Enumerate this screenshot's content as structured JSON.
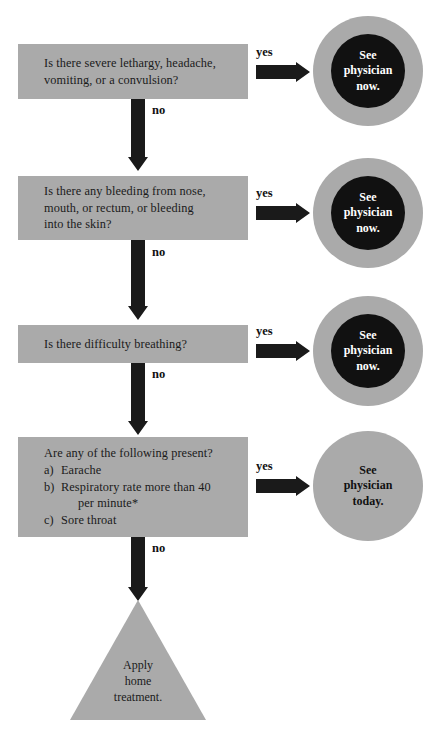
{
  "chart": {
    "colors": {
      "box_fill": "#aaaaaa",
      "ring_fill": "#aaaaaa",
      "core_fill": "#111111",
      "arrow_fill": "#1a1a1a",
      "text_dark": "#1a1a1a",
      "text_light": "#ffffff",
      "background": "#ffffff"
    }
  },
  "questions": [
    {
      "id": "q1",
      "line1": "Is there severe lethargy, headache,",
      "line2": "vomiting, or a convulsion?"
    },
    {
      "id": "q2",
      "line1": "Is there any bleeding from nose,",
      "line2": "mouth, or rectum, or bleeding",
      "line3": "into the skin?"
    },
    {
      "id": "q3",
      "line1": "Is there difficulty breathing?"
    },
    {
      "id": "q4",
      "lead": "Are any of the following present?",
      "items": [
        {
          "marker": "a)",
          "text": "Earache"
        },
        {
          "marker": "b)",
          "text": "Respiratory rate more than 40",
          "cont": "per minute*"
        },
        {
          "marker": "c)",
          "text": "Sore throat"
        }
      ]
    }
  ],
  "outcomes": [
    {
      "id": "o1",
      "line1": "See",
      "line2": "physician",
      "line3": "now.",
      "style": "ring-core"
    },
    {
      "id": "o2",
      "line1": "See",
      "line2": "physician",
      "line3": "now.",
      "style": "ring-core"
    },
    {
      "id": "o3",
      "line1": "See",
      "line2": "physician",
      "line3": "now.",
      "style": "ring-core"
    },
    {
      "id": "o4",
      "line1": "See",
      "line2": "physician",
      "line3": "today.",
      "style": "plain"
    }
  ],
  "terminal": {
    "id": "t1",
    "line1": "Apply",
    "line2": "home",
    "line3": "treatment."
  },
  "edge_labels": {
    "yes": "yes",
    "no": "no"
  }
}
